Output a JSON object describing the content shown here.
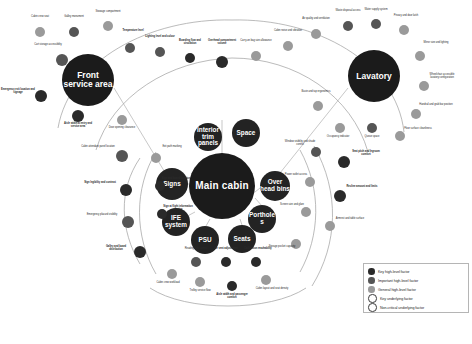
{
  "diagram": {
    "type": "radial-network",
    "background": "#ffffff"
  },
  "colors": {
    "key_high_level": "#2a2a2a",
    "important_high_level": "#555555",
    "general_high_level": "#9a9a9a",
    "key_underlying": "#ffffff",
    "non_critical_underlying": "#ffffff",
    "hub": "#1b1b1b",
    "link": "#9e9e9e"
  },
  "hubs": [
    {
      "id": "front-service-area",
      "label": "Front service area",
      "x": 88,
      "y": 80,
      "r": 26
    },
    {
      "id": "main-cabin",
      "label": "Main cabin",
      "x": 222,
      "y": 186,
      "r": 33
    },
    {
      "id": "lavatory",
      "label": "Lavatory",
      "x": 374,
      "y": 76,
      "r": 26
    }
  ],
  "secondary_nodes": [
    {
      "id": "interior-trim-panels",
      "label": "Interior trim panels",
      "x": 208,
      "y": 137,
      "r": 14
    },
    {
      "id": "space",
      "label": "Space",
      "x": 246,
      "y": 133,
      "r": 14
    },
    {
      "id": "signs",
      "label": "Signs",
      "x": 172,
      "y": 184,
      "r": 16
    },
    {
      "id": "ife-system",
      "label": "IFE system",
      "x": 176,
      "y": 222,
      "r": 14
    },
    {
      "id": "psu",
      "label": "PSU",
      "x": 205,
      "y": 240,
      "r": 14
    },
    {
      "id": "seats",
      "label": "Seats",
      "x": 242,
      "y": 239,
      "r": 14
    },
    {
      "id": "over-head-bins",
      "label": "Over head bins",
      "x": 275,
      "y": 186,
      "r": 15
    },
    {
      "id": "portholes",
      "label": "Portholes",
      "x": 262,
      "y": 219,
      "r": 14
    }
  ],
  "legend": {
    "items": [
      {
        "label": "Key high-level factor",
        "tier": "key_high_level",
        "color": "#2a2a2a",
        "filled": true
      },
      {
        "label": "Important high-level factor",
        "tier": "important_high_level",
        "color": "#555555",
        "filled": true
      },
      {
        "label": "General high-level factor",
        "tier": "general_high_level",
        "color": "#9a9a9a",
        "filled": true
      },
      {
        "label": "Key underlying factor",
        "tier": "key_underlying",
        "color": "#ffffff",
        "filled": false
      },
      {
        "label": "Non-critical underlying factor",
        "tier": "non_critical_underlying",
        "color": "#ffffff",
        "filled": false
      }
    ]
  },
  "satellites": [
    {
      "x": 40,
      "y": 32,
      "r": 5,
      "tier": "t-gen",
      "lx": 40,
      "ly": 20,
      "label": "Cabin crew seat",
      "bold": false
    },
    {
      "x": 74,
      "y": 32,
      "r": 5,
      "tier": "t-imp",
      "lx": 74,
      "ly": 20,
      "label": "Galley monument",
      "bold": false
    },
    {
      "x": 108,
      "y": 26,
      "r": 5,
      "tier": "t-gen",
      "lx": 108,
      "ly": 15,
      "label": "Stowage compartment",
      "bold": false
    },
    {
      "x": 130,
      "y": 48,
      "r": 5,
      "tier": "t-imp",
      "lx": 133,
      "ly": 34,
      "label": "Temperature level",
      "bold": true
    },
    {
      "x": 62,
      "y": 60,
      "r": 6,
      "tier": "t-imp",
      "lx": 48,
      "ly": 48,
      "label": "Cart storage accessibility",
      "bold": false
    },
    {
      "x": 41,
      "y": 96,
      "r": 6,
      "tier": "t-key",
      "lx": 18,
      "ly": 93,
      "label": "Emergency exit location and signage",
      "bold": true
    },
    {
      "x": 78,
      "y": 116,
      "r": 6,
      "tier": "t-key",
      "lx": 78,
      "ly": 127,
      "label": "Aisle width at entry and service area",
      "bold": true
    },
    {
      "x": 122,
      "y": 120,
      "r": 5,
      "tier": "t-gen",
      "lx": 122,
      "ly": 131,
      "label": "Door opening clearance",
      "bold": false
    },
    {
      "x": 160,
      "y": 52,
      "r": 5,
      "tier": "t-imp",
      "lx": 160,
      "ly": 40,
      "label": "Lighting level and colour",
      "bold": true
    },
    {
      "x": 190,
      "y": 58,
      "r": 5,
      "tier": "t-key",
      "lx": 190,
      "ly": 44,
      "label": "Boarding flow and circulation",
      "bold": true
    },
    {
      "x": 222,
      "y": 62,
      "r": 6,
      "tier": "t-key",
      "lx": 222,
      "ly": 44,
      "label": "Overhead compartment volume",
      "bold": true
    },
    {
      "x": 256,
      "y": 56,
      "r": 5,
      "tier": "t-gen",
      "lx": 256,
      "ly": 44,
      "label": "Carry-on bag size allowance",
      "bold": false
    },
    {
      "x": 288,
      "y": 46,
      "r": 5,
      "tier": "t-gen",
      "lx": 288,
      "ly": 34,
      "label": "Cabin noise and vibration",
      "bold": false
    },
    {
      "x": 316,
      "y": 34,
      "r": 5,
      "tier": "t-gen",
      "lx": 316,
      "ly": 22,
      "label": "Air quality and ventilation",
      "bold": false
    },
    {
      "x": 348,
      "y": 26,
      "r": 5,
      "tier": "t-imp",
      "lx": 348,
      "ly": 14,
      "label": "Waste disposal access",
      "bold": false
    },
    {
      "x": 376,
      "y": 24,
      "r": 5,
      "tier": "t-imp",
      "lx": 376,
      "ly": 13,
      "label": "Water supply system",
      "bold": false
    },
    {
      "x": 404,
      "y": 30,
      "r": 5,
      "tier": "t-gen",
      "lx": 406,
      "ly": 19,
      "label": "Privacy and door latch",
      "bold": false
    },
    {
      "x": 420,
      "y": 56,
      "r": 5,
      "tier": "t-gen",
      "lx": 436,
      "ly": 46,
      "label": "Mirror size and lighting",
      "bold": false
    },
    {
      "x": 424,
      "y": 86,
      "r": 5,
      "tier": "t-gen",
      "lx": 442,
      "ly": 78,
      "label": "Wheelchair accessible lavatory configuration",
      "bold": false
    },
    {
      "x": 416,
      "y": 114,
      "r": 5,
      "tier": "t-gen",
      "lx": 436,
      "ly": 108,
      "label": "Handrail and grab bar position",
      "bold": false
    },
    {
      "x": 400,
      "y": 136,
      "r": 5,
      "tier": "t-gen",
      "lx": 418,
      "ly": 132,
      "label": "Floor surface cleanliness",
      "bold": false
    },
    {
      "x": 372,
      "y": 128,
      "r": 5,
      "tier": "t-imp",
      "lx": 372,
      "ly": 140,
      "label": "Queue space",
      "bold": false
    },
    {
      "x": 340,
      "y": 128,
      "r": 5,
      "tier": "t-gen",
      "lx": 338,
      "ly": 140,
      "label": "Occupancy indicator",
      "bold": false
    },
    {
      "x": 318,
      "y": 106,
      "r": 5,
      "tier": "t-gen",
      "lx": 316,
      "ly": 95,
      "label": "Basin and tap ergonomics",
      "bold": false
    },
    {
      "x": 344,
      "y": 162,
      "r": 6,
      "tier": "t-key",
      "lx": 366,
      "ly": 155,
      "label": "Seat pitch and legroom comfort",
      "bold": true
    },
    {
      "x": 340,
      "y": 196,
      "r": 6,
      "tier": "t-key",
      "lx": 362,
      "ly": 190,
      "label": "Recline amount and limits",
      "bold": true
    },
    {
      "x": 330,
      "y": 226,
      "r": 5,
      "tier": "t-gen",
      "lx": 350,
      "ly": 222,
      "label": "Armrest and table surface",
      "bold": false
    },
    {
      "x": 316,
      "y": 152,
      "r": 5,
      "tier": "t-imp",
      "lx": 300,
      "ly": 145,
      "label": "Window visibility and shade control",
      "bold": false
    },
    {
      "x": 310,
      "y": 182,
      "r": 5,
      "tier": "t-gen",
      "lx": 296,
      "ly": 178,
      "label": "Power outlet access",
      "bold": false
    },
    {
      "x": 306,
      "y": 212,
      "r": 5,
      "tier": "t-gen",
      "lx": 292,
      "ly": 208,
      "label": "Screen size and glare",
      "bold": false
    },
    {
      "x": 296,
      "y": 244,
      "r": 5,
      "tier": "t-gen",
      "lx": 282,
      "ly": 250,
      "label": "Storage pocket capacity",
      "bold": false
    },
    {
      "x": 122,
      "y": 156,
      "r": 6,
      "tier": "t-imp",
      "lx": 98,
      "ly": 150,
      "label": "Cabin attendant panel location",
      "bold": false
    },
    {
      "x": 126,
      "y": 190,
      "r": 6,
      "tier": "t-key",
      "lx": 100,
      "ly": 186,
      "label": "Sign legibility and contrast",
      "bold": true
    },
    {
      "x": 128,
      "y": 222,
      "r": 6,
      "tier": "t-imp",
      "lx": 102,
      "ly": 218,
      "label": "Emergency placard visibility",
      "bold": false
    },
    {
      "x": 140,
      "y": 252,
      "r": 6,
      "tier": "t-key",
      "lx": 116,
      "ly": 250,
      "label": "Galley and board distribution",
      "bold": true
    },
    {
      "x": 156,
      "y": 158,
      "r": 5,
      "tier": "t-gen",
      "lx": 172,
      "ly": 150,
      "label": "Exit path marking",
      "bold": false
    },
    {
      "x": 160,
      "y": 186,
      "r": 5,
      "tier": "t-key",
      "lx": 176,
      "ly": 182,
      "label": "Sign and board location",
      "bold": true
    },
    {
      "x": 162,
      "y": 214,
      "r": 5,
      "tier": "t-key",
      "lx": 178,
      "ly": 210,
      "label": "Sign at flight information service",
      "bold": true
    },
    {
      "x": 172,
      "y": 274,
      "r": 5,
      "tier": "t-gen",
      "lx": 168,
      "ly": 286,
      "label": "Cabin crew workload",
      "bold": false
    },
    {
      "x": 200,
      "y": 282,
      "r": 5,
      "tier": "t-gen",
      "lx": 200,
      "ly": 294,
      "label": "Trolley service flow",
      "bold": false
    },
    {
      "x": 232,
      "y": 286,
      "r": 5,
      "tier": "t-key",
      "lx": 232,
      "ly": 298,
      "label": "Aisle width and passenger comfort",
      "bold": true
    },
    {
      "x": 266,
      "y": 280,
      "r": 5,
      "tier": "t-gen",
      "lx": 272,
      "ly": 292,
      "label": "Cabin layout and seat density",
      "bold": false
    },
    {
      "x": 196,
      "y": 262,
      "r": 5,
      "tier": "t-imp",
      "lx": 196,
      "ly": 252,
      "label": "Reading light control",
      "bold": false
    },
    {
      "x": 226,
      "y": 262,
      "r": 5,
      "tier": "t-key",
      "lx": 226,
      "ly": 252,
      "label": "Air vent adjustment",
      "bold": true
    },
    {
      "x": 256,
      "y": 262,
      "r": 5,
      "tier": "t-key",
      "lx": 258,
      "ly": 252,
      "label": "Call button reachability",
      "bold": true
    }
  ]
}
